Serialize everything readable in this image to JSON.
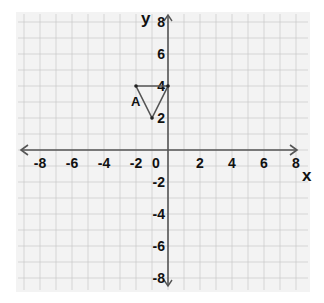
{
  "diagram": {
    "type": "coordinate-plane",
    "x_axis_label": "x",
    "y_axis_label": "y",
    "x_range": [
      -8,
      8
    ],
    "y_range": [
      -8,
      8
    ],
    "x_ticks": [
      "-8",
      "-6",
      "-4",
      "-2",
      "0",
      "2",
      "4",
      "6",
      "8"
    ],
    "y_ticks": [
      "8",
      "6",
      "4",
      "2",
      "-2",
      "-4",
      "-6",
      "-8"
    ],
    "grid_step": 1,
    "label_step": 2,
    "shape": {
      "name": "A",
      "type": "triangle",
      "vertices": [
        [
          -2,
          4
        ],
        [
          0,
          4
        ],
        [
          -1,
          2
        ]
      ],
      "label_position": [
        -2.2,
        3
      ]
    },
    "colors": {
      "paper": "#f3f3f3",
      "grid": "#c8c8c8",
      "axis": "#555555",
      "shape": "#555555",
      "text": "#111111"
    }
  }
}
